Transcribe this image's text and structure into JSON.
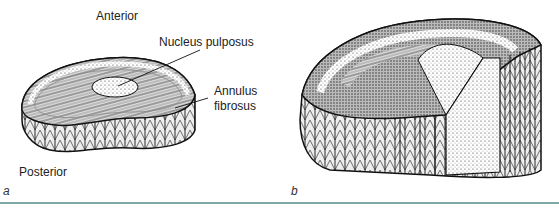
{
  "figure": {
    "panel_a": {
      "letter": "a",
      "labels": {
        "anterior": "Anterior",
        "posterior": "Posterior",
        "nucleus": "Nucleus pulposus",
        "annulus_line1": "Annulus",
        "annulus_line2": "fibrosus"
      }
    },
    "panel_b": {
      "letter": "b"
    },
    "rule_color": "#7fa8a4"
  }
}
